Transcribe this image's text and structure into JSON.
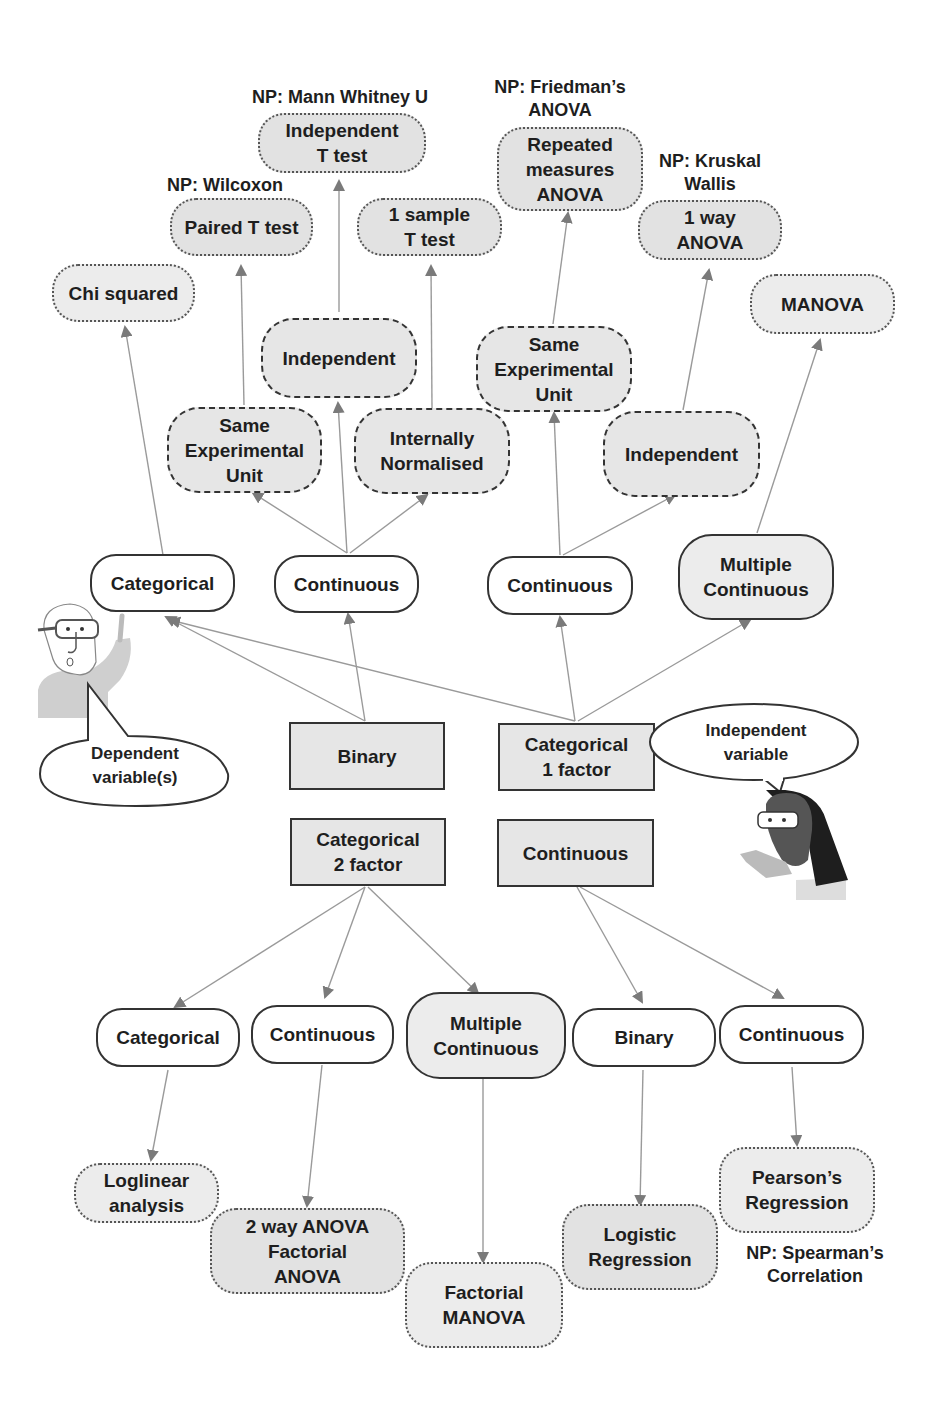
{
  "colors": {
    "edge": "#8a8a8a",
    "node_border": "#333333",
    "shaded_fill": "#e4e4e4",
    "white_fill": "#ffffff"
  },
  "speech_bubbles": {
    "dependent": "Dependent\nvariable(s)",
    "independent": "Independent\nvariable"
  },
  "independent_variables": [
    {
      "id": "iv_binary",
      "label": "Binary"
    },
    {
      "id": "iv_cat1",
      "label": "Categorical\n1 factor"
    },
    {
      "id": "iv_cat2",
      "label": "Categorical\n2 factor"
    },
    {
      "id": "iv_cont",
      "label": "Continuous"
    }
  ],
  "dependent_variables": {
    "top": [
      {
        "id": "dv_categorical",
        "label": "Categorical"
      },
      {
        "id": "dv_continuous_1",
        "label": "Continuous"
      },
      {
        "id": "dv_continuous_2",
        "label": "Continuous"
      },
      {
        "id": "dv_multi_continuous_1",
        "label": "Multiple\nContinuous"
      }
    ],
    "bottom": [
      {
        "id": "dv_categorical_b",
        "label": "Categorical"
      },
      {
        "id": "dv_continuous_b",
        "label": "Continuous"
      },
      {
        "id": "dv_multi_continuous_b",
        "label": "Multiple\nContinuous"
      },
      {
        "id": "dv_binary_b",
        "label": "Binary"
      },
      {
        "id": "dv_continuous_b2",
        "label": "Continuous"
      }
    ]
  },
  "conditions": [
    {
      "id": "c_same_1",
      "label": "Same\nExperimental\nUnit"
    },
    {
      "id": "c_indep_1",
      "label": "Independent"
    },
    {
      "id": "c_norm",
      "label": "Internally\nNormalised"
    },
    {
      "id": "c_same_2",
      "label": "Same\nExperimental\nUnit"
    },
    {
      "id": "c_indep_2",
      "label": "Independent"
    }
  ],
  "tests": [
    {
      "id": "t_chi",
      "label": "Chi squared",
      "np": ""
    },
    {
      "id": "t_paired",
      "label": "Paired T test",
      "np": "NP: Wilcoxon"
    },
    {
      "id": "t_indep",
      "label": "Independent\nT test",
      "np": "NP: Mann Whitney U"
    },
    {
      "id": "t_onesample",
      "label": "1 sample\nT test",
      "np": ""
    },
    {
      "id": "t_rm",
      "label": "Repeated\nmeasures\nANOVA",
      "np": "NP: Friedman’s\nANOVA"
    },
    {
      "id": "t_oneway",
      "label": "1 way\nANOVA",
      "np": "NP: Kruskal\nWallis"
    },
    {
      "id": "t_manova",
      "label": "MANOVA",
      "np": ""
    },
    {
      "id": "t_loglinear",
      "label": "Loglinear\nanalysis",
      "np": ""
    },
    {
      "id": "t_2way",
      "label": "2 way ANOVA\nFactorial\nANOVA",
      "np": ""
    },
    {
      "id": "t_fmanova",
      "label": "Factorial\nMANOVA",
      "np": ""
    },
    {
      "id": "t_logistic",
      "label": "Logistic\nRegression",
      "np": ""
    },
    {
      "id": "t_pearson",
      "label": "Pearson’s\nRegression",
      "np": "NP: Spearman’s\nCorrelation"
    }
  ],
  "edges": [
    [
      "iv_binary",
      "dv_categorical"
    ],
    [
      "iv_binary",
      "dv_continuous_1"
    ],
    [
      "iv_cat1",
      "dv_categorical"
    ],
    [
      "iv_cat1",
      "dv_continuous_2"
    ],
    [
      "iv_cat1",
      "dv_multi_continuous_1"
    ],
    [
      "dv_categorical",
      "t_chi"
    ],
    [
      "dv_continuous_1",
      "c_same_1"
    ],
    [
      "dv_continuous_1",
      "c_indep_1"
    ],
    [
      "dv_continuous_1",
      "c_norm"
    ],
    [
      "c_same_1",
      "t_paired"
    ],
    [
      "c_indep_1",
      "t_indep"
    ],
    [
      "c_norm",
      "t_onesample"
    ],
    [
      "dv_continuous_2",
      "c_same_2"
    ],
    [
      "dv_continuous_2",
      "c_indep_2"
    ],
    [
      "c_same_2",
      "t_rm"
    ],
    [
      "c_indep_2",
      "t_oneway"
    ],
    [
      "dv_multi_continuous_1",
      "t_manova"
    ],
    [
      "iv_cat2",
      "dv_categorical_b"
    ],
    [
      "iv_cat2",
      "dv_continuous_b"
    ],
    [
      "iv_cat2",
      "dv_multi_continuous_b"
    ],
    [
      "iv_cont",
      "dv_binary_b"
    ],
    [
      "iv_cont",
      "dv_continuous_b2"
    ],
    [
      "dv_categorical_b",
      "t_loglinear"
    ],
    [
      "dv_continuous_b",
      "t_2way"
    ],
    [
      "dv_multi_continuous_b",
      "t_fmanova"
    ],
    [
      "dv_binary_b",
      "t_logistic"
    ],
    [
      "dv_continuous_b2",
      "t_pearson"
    ]
  ]
}
